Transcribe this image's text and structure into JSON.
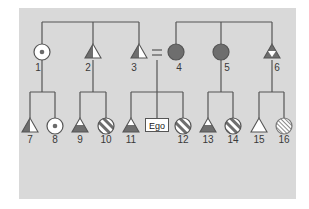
{
  "diagram": {
    "type": "kinship-pedigree",
    "background_color": "#d9d9d9",
    "line_color": "#555555",
    "fill_dark": "#707070",
    "fill_light": "#ffffff",
    "ego_label": "Ego",
    "marriage_symbol": "=",
    "generation_1": [
      {
        "id": "1",
        "shape": "circle",
        "fill": "white-with-dot"
      },
      {
        "id": "2",
        "shape": "triangle",
        "fill": "half-dark-left"
      },
      {
        "id": "3",
        "shape": "triangle",
        "fill": "half-dark-left"
      },
      {
        "id": "4",
        "shape": "circle",
        "fill": "dark"
      },
      {
        "id": "5",
        "shape": "circle",
        "fill": "dark"
      },
      {
        "id": "6",
        "shape": "triangle",
        "fill": "dark-with-white-inverted-triangle"
      }
    ],
    "generation_2": [
      {
        "id": "7",
        "shape": "triangle",
        "fill": "half-dark-left"
      },
      {
        "id": "8",
        "shape": "circle",
        "fill": "white-with-dot"
      },
      {
        "id": "9",
        "shape": "triangle",
        "fill": "dark-bottom"
      },
      {
        "id": "10",
        "shape": "circle",
        "fill": "diagonal-stripes"
      },
      {
        "id": "11",
        "shape": "triangle",
        "fill": "dark-bottom"
      },
      {
        "id": "Ego",
        "shape": "box",
        "fill": "white"
      },
      {
        "id": "12",
        "shape": "circle",
        "fill": "diagonal-stripes"
      },
      {
        "id": "13",
        "shape": "triangle",
        "fill": "dark-bottom"
      },
      {
        "id": "14",
        "shape": "circle",
        "fill": "diagonal-stripes"
      },
      {
        "id": "15",
        "shape": "triangle",
        "fill": "white"
      },
      {
        "id": "16",
        "shape": "circle",
        "fill": "fine-hatch"
      }
    ],
    "labels": [
      "1",
      "2",
      "3",
      "4",
      "5",
      "6",
      "7",
      "8",
      "9",
      "10",
      "11",
      "12",
      "13",
      "14",
      "15",
      "16"
    ]
  }
}
